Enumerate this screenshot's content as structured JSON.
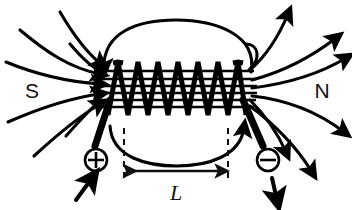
{
  "figure": {
    "background_color": "#ffffff",
    "ink_color": "#000000"
  },
  "labels": {
    "south_pole": "S",
    "north_pole": "N",
    "length": "L",
    "positive_terminal": "⊕",
    "negative_terminal": "⊖"
  },
  "solenoid": {
    "turns": 5,
    "core_field_lines": 6,
    "coil_left_x": 104,
    "coil_right_x": 248,
    "coil_top_y": 62,
    "coil_bottom_y": 112
  },
  "dimension": {
    "label": "L",
    "left_x": 124,
    "right_x": 228,
    "arrow_y": 171,
    "dash_top_y": 128,
    "dash_bottom_y": 182
  },
  "field_lines": {
    "description": "Magnetic flux lines exit the north pole on the right and re-enter the south pole on the left",
    "outer_loops": 2,
    "external_strands": 8,
    "arrowheads": 14
  },
  "terminals": {
    "positive": {
      "symbol": "⊕",
      "cx": 96,
      "cy": 160,
      "radius": 11,
      "current_arrow": "up"
    },
    "negative": {
      "symbol": "⊖",
      "cx": 268,
      "cy": 160,
      "radius": 11,
      "current_arrow": "down"
    }
  }
}
